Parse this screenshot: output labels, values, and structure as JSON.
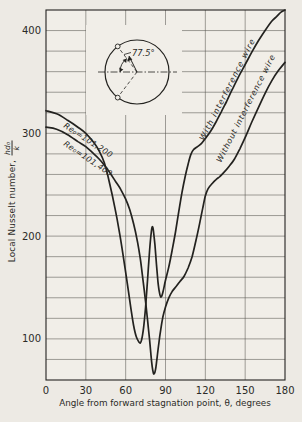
{
  "chart_data": {
    "type": "line",
    "title": "",
    "xlabel": "Angle from forward stagnation point, θ, degrees",
    "ylabel": "Local Nusselt number, hd₀/k",
    "xlim": [
      0,
      180
    ],
    "ylim": [
      60,
      420
    ],
    "x_ticks": [
      0,
      30,
      60,
      90,
      120,
      150,
      180
    ],
    "y_ticks": [
      100,
      200,
      300,
      400
    ],
    "grid": {
      "x_step": 30,
      "y_step": 20,
      "on": true
    },
    "series": [
      {
        "name": "With interference wire (Re₀=101,200)",
        "points": [
          [
            0,
            322
          ],
          [
            8,
            319
          ],
          [
            16,
            313
          ],
          [
            24,
            306
          ],
          [
            30,
            300
          ],
          [
            36,
            291
          ],
          [
            40,
            283
          ],
          [
            44,
            271
          ],
          [
            48,
            251
          ],
          [
            52,
            227
          ],
          [
            55,
            206
          ],
          [
            58,
            182
          ],
          [
            61,
            156
          ],
          [
            64,
            129
          ],
          [
            66,
            113
          ],
          [
            68,
            102
          ],
          [
            70,
            97
          ],
          [
            71,
            96
          ],
          [
            72,
            99
          ],
          [
            73.5,
            111
          ],
          [
            75,
            131
          ],
          [
            76.5,
            158
          ],
          [
            78,
            186
          ],
          [
            79.2,
            203
          ],
          [
            80,
            209
          ],
          [
            80.8,
            206
          ],
          [
            82,
            192
          ],
          [
            83.2,
            172
          ],
          [
            84.3,
            156
          ],
          [
            85.3,
            146
          ],
          [
            86.3,
            141
          ],
          [
            87.3,
            142
          ],
          [
            88.5,
            148
          ],
          [
            90,
            157
          ],
          [
            92.5,
            170
          ],
          [
            95,
            186
          ],
          [
            97.5,
            204
          ],
          [
            100,
            224
          ],
          [
            102.5,
            243
          ],
          [
            105,
            259
          ],
          [
            107,
            270
          ],
          [
            109,
            279
          ],
          [
            111,
            284
          ],
          [
            114,
            287
          ],
          [
            117,
            290
          ],
          [
            120,
            295
          ],
          [
            124,
            302
          ],
          [
            128,
            311
          ],
          [
            132,
            321
          ],
          [
            136,
            331
          ],
          [
            140,
            342
          ],
          [
            145,
            355
          ],
          [
            150,
            367
          ],
          [
            155,
            379
          ],
          [
            160,
            390
          ],
          [
            165,
            400
          ],
          [
            170,
            409
          ],
          [
            174,
            414
          ],
          [
            177,
            418
          ],
          [
            180,
            420
          ]
        ]
      },
      {
        "name": "Without interference wire (Re₀=101,400)",
        "points": [
          [
            0,
            306
          ],
          [
            8,
            304
          ],
          [
            16,
            299
          ],
          [
            24,
            292
          ],
          [
            30,
            287
          ],
          [
            36,
            280
          ],
          [
            40,
            275
          ],
          [
            44,
            269
          ],
          [
            48,
            262
          ],
          [
            52,
            254
          ],
          [
            56,
            246
          ],
          [
            60,
            236
          ],
          [
            63,
            226
          ],
          [
            66,
            212
          ],
          [
            69,
            194
          ],
          [
            71,
            178
          ],
          [
            73,
            158
          ],
          [
            75,
            136
          ],
          [
            76.5,
            118
          ],
          [
            78,
            99
          ],
          [
            79,
            85
          ],
          [
            80,
            73
          ],
          [
            80.8,
            67
          ],
          [
            81.5,
            66
          ],
          [
            82.5,
            70
          ],
          [
            83.5,
            80
          ],
          [
            85,
            96
          ],
          [
            86.5,
            110
          ],
          [
            88,
            121
          ],
          [
            90,
            131
          ],
          [
            92.5,
            140
          ],
          [
            95,
            146
          ],
          [
            98,
            151
          ],
          [
            101,
            156
          ],
          [
            104,
            161
          ],
          [
            107,
            169
          ],
          [
            110,
            180
          ],
          [
            113,
            196
          ],
          [
            116,
            214
          ],
          [
            118,
            227
          ],
          [
            120,
            239
          ],
          [
            122,
            246
          ],
          [
            125,
            251
          ],
          [
            128,
            255
          ],
          [
            131,
            258
          ],
          [
            134,
            262
          ],
          [
            138,
            268
          ],
          [
            142,
            275
          ],
          [
            146,
            285
          ],
          [
            150,
            296
          ],
          [
            155,
            311
          ],
          [
            160,
            325
          ],
          [
            165,
            339
          ],
          [
            170,
            351
          ],
          [
            175,
            361
          ],
          [
            180,
            369
          ]
        ]
      }
    ],
    "annotations": {
      "re_with": "Re₀=101,200",
      "re_without": "Re₀=101,400",
      "with_wire": "With interference wire",
      "without_wire": "Without interference wire",
      "inset_angle": "77.5°"
    },
    "legend_position": "labels-on-curves"
  },
  "axes": {
    "y_title_text": "Local Nusselt number,",
    "y_frac_num": "hd₀",
    "y_frac_den": "k",
    "x_title": "Angle from forward stagnation point, θ, degrees"
  },
  "colors": {
    "line": "#23221f",
    "grid": "#56544f",
    "bg": "#edeae4",
    "plot_bg": "#f1eee8"
  }
}
